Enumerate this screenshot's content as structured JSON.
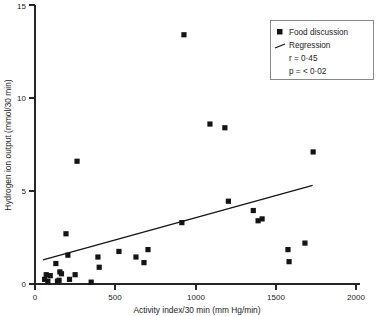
{
  "chart_data": {
    "type": "scatter",
    "title": "",
    "xlabel": "Activity index/30 min (mm Hg/min)",
    "ylabel": "Hydrogen ion output (mmol/30 min)",
    "xlim": [
      0,
      2000
    ],
    "ylim": [
      0,
      15
    ],
    "xticks": [
      0,
      500,
      1000,
      1500,
      2000
    ],
    "yticks": [
      0,
      5,
      10,
      15
    ],
    "xticklabels": [
      "0",
      "500",
      "1000",
      "1500",
      "2000"
    ],
    "yticklabels": [
      "0",
      "5",
      "10",
      "15"
    ],
    "grid": false,
    "legend_position": "top-right",
    "marker_color": "#141414",
    "line_color": "#141414",
    "series": [
      {
        "name": "Food discussion",
        "type": "scatter",
        "marker": "square",
        "points": [
          {
            "x": 60,
            "y": 0.25
          },
          {
            "x": 70,
            "y": 0.5
          },
          {
            "x": 80,
            "y": 0.15
          },
          {
            "x": 95,
            "y": 0.45
          },
          {
            "x": 130,
            "y": 1.1
          },
          {
            "x": 140,
            "y": 0.15
          },
          {
            "x": 150,
            "y": 0.2
          },
          {
            "x": 155,
            "y": 0.65
          },
          {
            "x": 165,
            "y": 0.55
          },
          {
            "x": 193,
            "y": 2.7
          },
          {
            "x": 205,
            "y": 1.55
          },
          {
            "x": 215,
            "y": 0.25
          },
          {
            "x": 250,
            "y": 0.5
          },
          {
            "x": 262,
            "y": 6.6
          },
          {
            "x": 350,
            "y": 0.1
          },
          {
            "x": 392,
            "y": 1.45
          },
          {
            "x": 400,
            "y": 0.9
          },
          {
            "x": 523,
            "y": 1.75
          },
          {
            "x": 629,
            "y": 1.45
          },
          {
            "x": 679,
            "y": 1.15
          },
          {
            "x": 704,
            "y": 1.85
          },
          {
            "x": 915,
            "y": 3.3
          },
          {
            "x": 928,
            "y": 13.4
          },
          {
            "x": 1090,
            "y": 8.6
          },
          {
            "x": 1183,
            "y": 8.4
          },
          {
            "x": 1205,
            "y": 4.45
          },
          {
            "x": 1360,
            "y": 3.95
          },
          {
            "x": 1390,
            "y": 3.4
          },
          {
            "x": 1415,
            "y": 3.5
          },
          {
            "x": 1576,
            "y": 1.85
          },
          {
            "x": 1583,
            "y": 1.2
          },
          {
            "x": 1682,
            "y": 2.2
          },
          {
            "x": 1733,
            "y": 7.1
          }
        ]
      },
      {
        "name": "Regression",
        "type": "line",
        "endpoints": [
          {
            "x": 50,
            "y": 1.3
          },
          {
            "x": 1730,
            "y": 5.3
          }
        ]
      }
    ],
    "legend": {
      "entries": [
        {
          "label": "Food discussion",
          "symbol": "square-marker"
        },
        {
          "label": "Regression",
          "symbol": "line-segment"
        }
      ],
      "stats": [
        "r = 0·45",
        "p = < 0·02"
      ]
    }
  }
}
